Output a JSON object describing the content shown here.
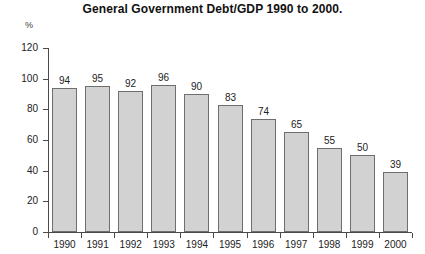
{
  "chart_data": {
    "type": "bar",
    "title": "General Government Debt/GDP 1990 to 2000.",
    "xlabel": "",
    "ylabel": "%",
    "ylim": [
      0,
      120
    ],
    "yticks": [
      0,
      20,
      40,
      60,
      80,
      100,
      120
    ],
    "grid": false,
    "legend": null,
    "bar_fill_color": "#d2d2d2",
    "bar_border_color": "#6e6e6e",
    "axis_color": "#4a4a4a",
    "text_color": "#222222",
    "categories": [
      "1990",
      "1991",
      "1992",
      "1993",
      "1994",
      "1995",
      "1996",
      "1997",
      "1998",
      "1999",
      "2000"
    ],
    "values": [
      94,
      95,
      92,
      96,
      90,
      83,
      74,
      65,
      55,
      50,
      39
    ],
    "value_labels": [
      "94",
      "95",
      "92",
      "96",
      "90",
      "83",
      "74",
      "65",
      "55",
      "50",
      "39"
    ]
  }
}
